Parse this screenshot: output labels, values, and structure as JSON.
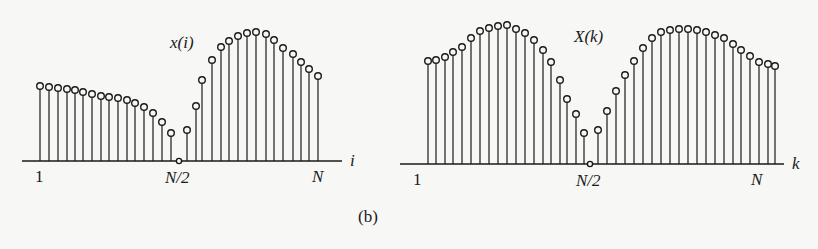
{
  "figure": {
    "caption": "(b)",
    "ink_color": "#1a1a1a",
    "background": "#f7f7f5"
  },
  "chart_data": [
    {
      "type": "stem",
      "title": "x(i)",
      "xlabel": "i",
      "ylabel": "",
      "x_tick_labels": [
        "1",
        "N/2",
        "N"
      ],
      "grid": false,
      "legend": null,
      "axis": {
        "x0": 22,
        "x1": 342,
        "baseline_y": 161,
        "xlabel_x": 350,
        "title_x": 170,
        "title_y": 48
      },
      "tick_positions": {
        "1": 40,
        "N/2": 179,
        "N": 318
      },
      "description": "Time-domain sequence: slowly decaying from i=1 to a zero at N/2, then rising sharply to a peak and decaying toward N",
      "n_points": 33,
      "points": [
        {
          "x": 40,
          "y": 86
        },
        {
          "x": 49,
          "y": 87
        },
        {
          "x": 58,
          "y": 88
        },
        {
          "x": 67,
          "y": 89
        },
        {
          "x": 75,
          "y": 90
        },
        {
          "x": 83,
          "y": 92
        },
        {
          "x": 92,
          "y": 94
        },
        {
          "x": 101,
          "y": 96
        },
        {
          "x": 109,
          "y": 97
        },
        {
          "x": 118,
          "y": 98
        },
        {
          "x": 127,
          "y": 100
        },
        {
          "x": 135,
          "y": 103
        },
        {
          "x": 144,
          "y": 107
        },
        {
          "x": 153,
          "y": 113
        },
        {
          "x": 162,
          "y": 122
        },
        {
          "x": 171,
          "y": 133
        },
        {
          "x": 179,
          "y": 161
        },
        {
          "x": 187,
          "y": 130
        },
        {
          "x": 196,
          "y": 106
        },
        {
          "x": 202,
          "y": 80
        },
        {
          "x": 212,
          "y": 60
        },
        {
          "x": 221,
          "y": 47
        },
        {
          "x": 229,
          "y": 41
        },
        {
          "x": 238,
          "y": 36
        },
        {
          "x": 247,
          "y": 33
        },
        {
          "x": 256,
          "y": 32
        },
        {
          "x": 266,
          "y": 34
        },
        {
          "x": 274,
          "y": 40
        },
        {
          "x": 283,
          "y": 48
        },
        {
          "x": 293,
          "y": 54
        },
        {
          "x": 301,
          "y": 62
        },
        {
          "x": 309,
          "y": 69
        },
        {
          "x": 318,
          "y": 76
        }
      ],
      "relative_values": [
        0.75,
        0.74,
        0.74,
        0.73,
        0.72,
        0.71,
        0.69,
        0.68,
        0.67,
        0.66,
        0.65,
        0.62,
        0.6,
        0.55,
        0.5,
        0.43,
        0.0,
        0.24,
        0.43,
        0.63,
        0.79,
        0.89,
        0.93,
        0.97,
        1.0,
        1.0,
        0.99,
        0.94,
        0.88,
        0.83,
        0.77,
        0.72,
        0.66
      ]
    },
    {
      "type": "stem",
      "title": "X(k)",
      "xlabel": "k",
      "ylabel": "",
      "x_tick_labels": [
        "1",
        "N/2",
        "N"
      ],
      "grid": false,
      "legend": null,
      "axis": {
        "x0": 400,
        "x1": 784,
        "baseline_y": 164,
        "xlabel_x": 792,
        "title_x": 574,
        "title_y": 42
      },
      "tick_positions": {
        "1": 418,
        "N/2": 590,
        "N": 757
      },
      "description": "Frequency-domain sequence: two symmetric humps with a zero at N/2",
      "n_points": 41,
      "points": [
        {
          "x": 428,
          "y": 61
        },
        {
          "x": 436,
          "y": 60
        },
        {
          "x": 445,
          "y": 57
        },
        {
          "x": 453,
          "y": 52
        },
        {
          "x": 462,
          "y": 47
        },
        {
          "x": 471,
          "y": 38
        },
        {
          "x": 480,
          "y": 31
        },
        {
          "x": 489,
          "y": 28
        },
        {
          "x": 498,
          "y": 26
        },
        {
          "x": 507,
          "y": 25
        },
        {
          "x": 516,
          "y": 29
        },
        {
          "x": 525,
          "y": 33
        },
        {
          "x": 534,
          "y": 40
        },
        {
          "x": 543,
          "y": 50
        },
        {
          "x": 551,
          "y": 62
        },
        {
          "x": 560,
          "y": 80
        },
        {
          "x": 567,
          "y": 99
        },
        {
          "x": 576,
          "y": 114
        },
        {
          "x": 584,
          "y": 133
        },
        {
          "x": 590,
          "y": 163
        },
        {
          "x": 598,
          "y": 130
        },
        {
          "x": 607,
          "y": 111
        },
        {
          "x": 616,
          "y": 91
        },
        {
          "x": 625,
          "y": 75
        },
        {
          "x": 634,
          "y": 61
        },
        {
          "x": 643,
          "y": 48
        },
        {
          "x": 652,
          "y": 38
        },
        {
          "x": 661,
          "y": 32
        },
        {
          "x": 670,
          "y": 30
        },
        {
          "x": 679,
          "y": 29
        },
        {
          "x": 688,
          "y": 29
        },
        {
          "x": 697,
          "y": 30
        },
        {
          "x": 706,
          "y": 32
        },
        {
          "x": 715,
          "y": 35
        },
        {
          "x": 724,
          "y": 38
        },
        {
          "x": 733,
          "y": 44
        },
        {
          "x": 741,
          "y": 50
        },
        {
          "x": 750,
          "y": 56
        },
        {
          "x": 759,
          "y": 62
        },
        {
          "x": 768,
          "y": 64
        },
        {
          "x": 775,
          "y": 66
        }
      ],
      "relative_values": [
        0.74,
        0.75,
        0.77,
        0.81,
        0.84,
        0.91,
        0.96,
        0.98,
        0.99,
        1.0,
        0.97,
        0.94,
        0.89,
        0.82,
        0.74,
        0.61,
        0.47,
        0.36,
        0.22,
        0.0,
        0.24,
        0.38,
        0.53,
        0.64,
        0.74,
        0.83,
        0.91,
        0.95,
        0.96,
        0.97,
        0.97,
        0.96,
        0.95,
        0.93,
        0.91,
        0.86,
        0.82,
        0.78,
        0.74,
        0.72,
        0.71
      ]
    }
  ]
}
